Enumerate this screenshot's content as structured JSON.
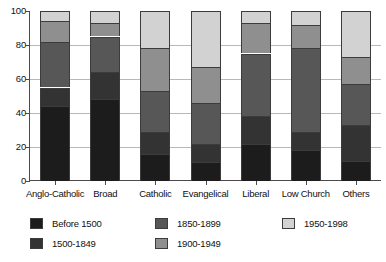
{
  "chart_data": {
    "type": "bar",
    "subtype": "stacked-bar",
    "title": "",
    "subtitle": "",
    "xlabel": "",
    "ylabel": "",
    "ylim": [
      0,
      100
    ],
    "yticks": [
      0,
      20,
      40,
      60,
      80,
      100
    ],
    "ytick_labels": [
      "0",
      "20",
      "40",
      "60",
      "80",
      "100"
    ],
    "grid": true,
    "grid_axis": "y",
    "legend_position": "bottom",
    "stacked_total": 100,
    "categories": [
      "Anglo-Catholic",
      "Broad",
      "Catholic",
      "Evangelical",
      "Liberal",
      "Low Church",
      "Others"
    ],
    "series": [
      {
        "name": "Before 1500",
        "color": "#1c1c1c",
        "values": [
          44,
          48,
          16,
          11,
          22,
          18,
          12
        ]
      },
      {
        "name": "1500-1849",
        "color": "#333333",
        "values": [
          11,
          16,
          13,
          11,
          16,
          11,
          21
        ]
      },
      {
        "name": "1850-1899",
        "color": "#575757",
        "values": [
          27,
          21,
          24,
          24,
          37,
          49,
          24
        ]
      },
      {
        "name": "1900-1949",
        "color": "#8f8f8f",
        "values": [
          12,
          8,
          25,
          21,
          18,
          14,
          16
        ]
      },
      {
        "name": "1950-1998",
        "color": "#d2d2d2",
        "values": [
          6,
          7,
          22,
          33,
          7,
          8,
          27
        ]
      }
    ],
    "cumulative_tops": [
      [
        44,
        55,
        82,
        94,
        100
      ],
      [
        48,
        64,
        85,
        93,
        100
      ],
      [
        16,
        29,
        53,
        78,
        100
      ],
      [
        11,
        22,
        46,
        67,
        100
      ],
      [
        22,
        38,
        75,
        93,
        100
      ],
      [
        18,
        29,
        78,
        92,
        100
      ],
      [
        12,
        33,
        57,
        73,
        100
      ]
    ]
  },
  "legend": {
    "entries": [
      {
        "label": "Before 1500",
        "color": "#1c1c1c"
      },
      {
        "label": "1500-1849",
        "color": "#333333"
      },
      {
        "label": "1850-1899",
        "color": "#575757"
      },
      {
        "label": "1900-1949",
        "color": "#8f8f8f"
      },
      {
        "label": "1950-1998",
        "color": "#d2d2d2"
      }
    ]
  },
  "colors": {
    "axis": "#4a4a4a",
    "gridline": "#b8b8b8",
    "text": "#111111",
    "background": "#ffffff",
    "bar_outline": "#3c3c3c"
  }
}
